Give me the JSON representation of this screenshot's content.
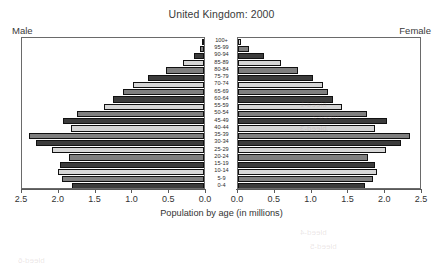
{
  "chart_data": {
    "type": "bar",
    "subtype": "population-pyramid",
    "title": "United Kingdom: 2000",
    "xlabel": "Population by age (in millions)",
    "ylabel": "",
    "left_caption": "Male",
    "right_caption": "Female",
    "categories": [
      "100+",
      "95-99",
      "90-94",
      "85-89",
      "80-84",
      "75-79",
      "70-74",
      "65-69",
      "60-64",
      "55-59",
      "50-54",
      "45-49",
      "40-44",
      "35-39",
      "30-34",
      "25-29",
      "20-24",
      "15-19",
      "10-14",
      "5-9",
      "0-4"
    ],
    "xlim_left": [
      2.5,
      0.0
    ],
    "xlim_right": [
      0.0,
      2.5
    ],
    "xticks_left": [
      "2.5",
      "2.0",
      "1.5",
      "1.0",
      "0.5",
      "0.0"
    ],
    "xticks_right": [
      "0.0",
      "0.5",
      "1.0",
      "1.5",
      "2.0",
      "2.5"
    ],
    "axis_max": 2.5,
    "grid": false,
    "legend": "none",
    "series": [
      {
        "name": "Male",
        "side": "left",
        "values": [
          0.01,
          0.05,
          0.14,
          0.29,
          0.51,
          0.76,
          0.96,
          1.1,
          1.23,
          1.36,
          1.72,
          1.92,
          1.81,
          2.38,
          2.28,
          2.07,
          1.83,
          1.95,
          1.98,
          1.93,
          1.8
        ]
      },
      {
        "name": "Female",
        "side": "right",
        "values": [
          0.04,
          0.15,
          0.35,
          0.58,
          0.82,
          1.02,
          1.15,
          1.22,
          1.29,
          1.41,
          1.75,
          2.02,
          1.86,
          2.34,
          2.22,
          2.01,
          1.77,
          1.86,
          1.89,
          1.84,
          1.72
        ]
      }
    ],
    "bar_tones": [
      "dark",
      "mid",
      "light"
    ],
    "colors": {
      "tone_dark": "#3c3c3c",
      "tone_mid": "#7f7f7f",
      "tone_light": "#d6d6d6",
      "frame": "#6a6a6a",
      "text": "#333333",
      "background": "#ffffff"
    }
  },
  "artifacts": [
    {
      "text": "bleed-1",
      "left": 300,
      "top": 100
    },
    {
      "text": "bleed-2",
      "left": 312,
      "top": 112
    },
    {
      "text": "bleed-3",
      "left": 300,
      "top": 124
    },
    {
      "text": "bleed-4",
      "left": 300,
      "top": 228
    },
    {
      "text": "bleed-5",
      "left": 310,
      "top": 242
    },
    {
      "text": "bleed-6",
      "left": 18,
      "top": 256
    }
  ]
}
